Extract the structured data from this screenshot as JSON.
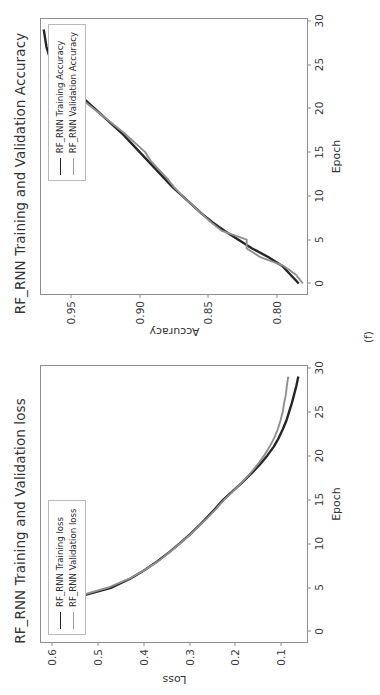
{
  "figure": {
    "caption": "(f)",
    "orientation": "rotated-90-ccw",
    "panel_count": 2
  },
  "loss_panel": {
    "title": "RF_RNN Training and Validation loss",
    "xlabel": "Epoch",
    "ylabel": "Loss",
    "yticks": [
      "0.6",
      "0.5",
      "0.4",
      "0.3",
      "0.2",
      "0.1"
    ],
    "xticks": [
      "0",
      "5",
      "10",
      "15",
      "20",
      "25",
      "30"
    ],
    "legend": [
      {
        "label": "RF_RNN Training loss",
        "color": "#262626"
      },
      {
        "label": "RF_RNN Validation loss",
        "color": "#8f8f8f"
      }
    ]
  },
  "accuracy_panel": {
    "title": "RF_RNN Training and Validation Accuracy",
    "xlabel": "Epoch",
    "ylabel": "Accuracy",
    "yticks": [
      "0.95",
      "0.90",
      "0.85",
      "0.80"
    ],
    "xticks": [
      "0",
      "5",
      "10",
      "15",
      "20",
      "25",
      "30"
    ],
    "legend": [
      {
        "label": "RF_RNN Training Accuracy",
        "color": "#262626"
      },
      {
        "label": "RF_RNN Validation Accuracy",
        "color": "#8f8f8f"
      }
    ]
  },
  "chart_data": [
    {
      "type": "line",
      "title": "RF_RNN Training and Validation loss",
      "xlabel": "Epoch",
      "ylabel": "Loss",
      "xlim": [
        -1.2,
        30.2
      ],
      "ylim": [
        0.043,
        0.625
      ],
      "xticks": [
        0,
        5,
        10,
        15,
        20,
        25,
        30
      ],
      "yticks": [
        0.6,
        0.5,
        0.4,
        0.3,
        0.2,
        0.1
      ],
      "grid": false,
      "legend_position": "upper-right",
      "x": [
        0,
        1,
        2,
        3,
        4,
        5,
        6,
        7,
        8,
        9,
        10,
        11,
        12,
        13,
        14,
        15,
        16,
        17,
        18,
        19,
        20,
        21,
        22,
        23,
        24,
        25,
        26,
        27,
        28,
        29
      ],
      "series": [
        {
          "name": "RF_RNN Training loss",
          "color": "#262626",
          "values": [
            0.592,
            0.578,
            0.565,
            0.552,
            0.54,
            0.47,
            0.43,
            0.398,
            0.37,
            0.345,
            0.322,
            0.3,
            0.28,
            0.261,
            0.243,
            0.226,
            0.205,
            0.184,
            0.164,
            0.146,
            0.13,
            0.116,
            0.105,
            0.096,
            0.088,
            0.082,
            0.076,
            0.071,
            0.066,
            0.062
          ]
        },
        {
          "name": "RF_RNN Validation loss",
          "color": "#8f8f8f",
          "values": [
            0.6,
            0.583,
            0.568,
            0.556,
            0.545,
            0.478,
            0.432,
            0.398,
            0.368,
            0.344,
            0.321,
            0.299,
            0.279,
            0.259,
            0.241,
            0.224,
            0.204,
            0.185,
            0.167,
            0.151,
            0.137,
            0.125,
            0.115,
            0.107,
            0.101,
            0.096,
            0.093,
            0.089,
            0.087,
            0.084
          ]
        }
      ]
    },
    {
      "type": "line",
      "title": "RF_RNN Training and Validation Accuracy",
      "xlabel": "Epoch",
      "ylabel": "Accuracy",
      "xlim": [
        -1.2,
        30.2
      ],
      "ylim": [
        0.778,
        0.972
      ],
      "xticks": [
        0,
        5,
        10,
        15,
        20,
        25,
        30
      ],
      "yticks": [
        0.95,
        0.9,
        0.85,
        0.8
      ],
      "grid": false,
      "legend_position": "lower-right",
      "x": [
        0,
        1,
        2,
        3,
        4,
        5,
        6,
        7,
        8,
        9,
        10,
        11,
        12,
        13,
        14,
        15,
        16,
        17,
        18,
        19,
        20,
        21,
        22,
        23,
        24,
        25,
        26,
        27,
        28,
        29
      ],
      "series": [
        {
          "name": "RF_RNN Training Accuracy",
          "color": "#262626",
          "values": [
            0.784,
            0.79,
            0.796,
            0.806,
            0.818,
            0.828,
            0.838,
            0.847,
            0.855,
            0.862,
            0.869,
            0.876,
            0.882,
            0.888,
            0.894,
            0.9,
            0.906,
            0.912,
            0.919,
            0.926,
            0.933,
            0.94,
            0.947,
            0.954,
            0.959,
            0.963,
            0.966,
            0.968,
            0.969,
            0.97
          ]
        },
        {
          "name": "RF_RNN Validation Accuracy",
          "color": "#8f8f8f",
          "values": [
            0.781,
            0.786,
            0.795,
            0.812,
            0.822,
            0.822,
            0.84,
            0.848,
            0.855,
            0.862,
            0.869,
            0.875,
            0.88,
            0.886,
            0.892,
            0.896,
            0.903,
            0.91,
            0.918,
            0.926,
            0.934,
            0.942,
            0.949,
            0.955,
            0.959,
            0.961,
            0.963,
            0.964,
            0.965,
            0.966
          ]
        }
      ]
    }
  ]
}
